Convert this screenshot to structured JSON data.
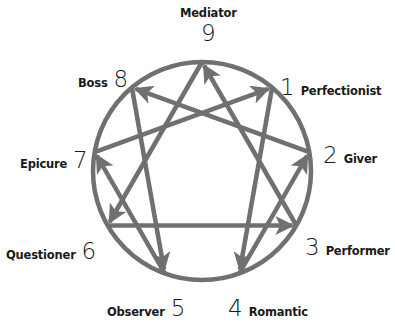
{
  "diagram": {
    "type": "enneagram",
    "colors": {
      "line": "#707070",
      "text": "#1a1a1a",
      "background": "#ffffff"
    },
    "points": [
      {
        "number": "9",
        "name": "Mediator"
      },
      {
        "number": "1",
        "name": "Perfectionist"
      },
      {
        "number": "2",
        "name": "Giver"
      },
      {
        "number": "3",
        "name": "Performer"
      },
      {
        "number": "4",
        "name": "Romantic"
      },
      {
        "number": "5",
        "name": "Observer"
      },
      {
        "number": "6",
        "name": "Questioner"
      },
      {
        "number": "7",
        "name": "Epicure"
      },
      {
        "number": "8",
        "name": "Boss"
      }
    ],
    "arrows": [
      {
        "from": "1",
        "to": "4"
      },
      {
        "from": "4",
        "to": "2"
      },
      {
        "from": "2",
        "to": "8"
      },
      {
        "from": "8",
        "to": "5"
      },
      {
        "from": "5",
        "to": "7"
      },
      {
        "from": "7",
        "to": "1"
      },
      {
        "from": "9",
        "to": "6"
      },
      {
        "from": "6",
        "to": "3"
      },
      {
        "from": "3",
        "to": "9"
      }
    ]
  }
}
